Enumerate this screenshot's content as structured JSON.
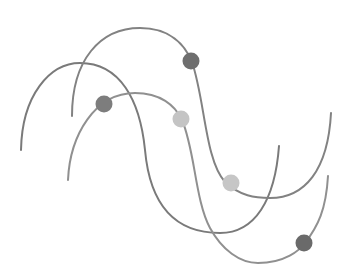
{
  "illustration": {
    "background": "#ffffff",
    "width": 354,
    "height": 276,
    "curves": [
      {
        "name": "wave-a",
        "color": "#7a7a7a",
        "stroke_width": 2,
        "path": "M21 150 C 22 95, 50 63, 80 63 C 120 63, 140 100, 145 150 C 150 205, 175 233, 220 233 C 255 233, 275 200, 279 146"
      },
      {
        "name": "wave-b",
        "color": "#828282",
        "stroke_width": 2,
        "path": "M72 116 C 72 60, 100 28, 140 28 C 170 28, 185 45, 192 62 C 205 100, 205 160, 225 182 C 240 196, 255 198, 270 198 C 305 198, 328 170, 331 113"
      },
      {
        "name": "wave-c",
        "color": "#909090",
        "stroke_width": 2,
        "path": "M68 180 C 70 135, 95 93, 135 93 C 160 93, 175 105, 182 120 C 195 150, 195 200, 210 228 C 222 250, 240 263, 258 263 C 285 263, 300 250, 305 243 C 318 226, 326 210, 328 176"
      }
    ],
    "dots": [
      {
        "name": "dot-dark-top",
        "cx": 191,
        "cy": 61,
        "r": 8.5,
        "color": "#6e6e6e"
      },
      {
        "name": "dot-mid-left",
        "cx": 104,
        "cy": 104,
        "r": 8.5,
        "color": "#7d7d7d"
      },
      {
        "name": "dot-light-center",
        "cx": 181,
        "cy": 119,
        "r": 8.5,
        "color": "#c4c4c4"
      },
      {
        "name": "dot-light-right",
        "cx": 231,
        "cy": 183,
        "r": 8.5,
        "color": "#c6c6c6"
      },
      {
        "name": "dot-dark-bottom",
        "cx": 304,
        "cy": 243,
        "r": 8.5,
        "color": "#6a6a6a"
      }
    ]
  }
}
